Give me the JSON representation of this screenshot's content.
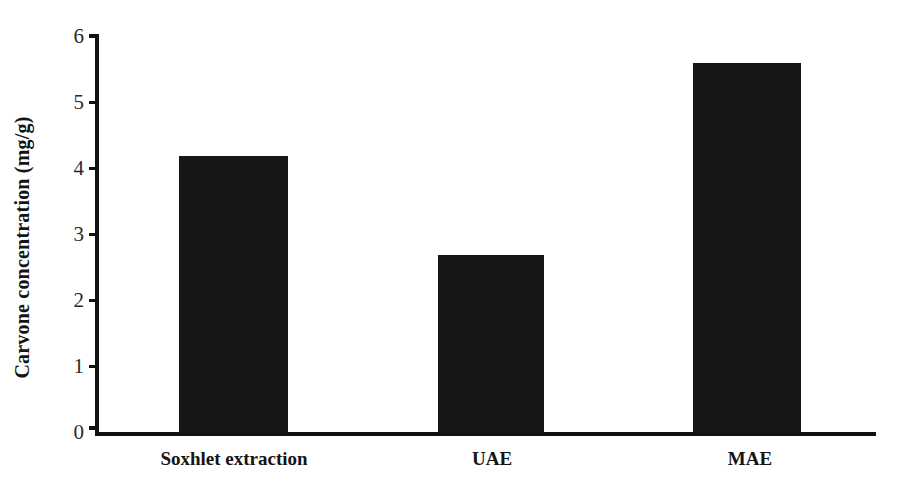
{
  "chart_data": {
    "type": "bar",
    "title": "",
    "xlabel": "",
    "ylabel": "Carvone concentration  (mg/g)",
    "categories": [
      "Soxhlet extraction",
      "UAE",
      "MAE"
    ],
    "values": [
      4.2,
      2.7,
      5.6
    ],
    "ylim": [
      0,
      6
    ],
    "yticks": [
      0,
      1,
      2,
      3,
      4,
      5,
      6
    ],
    "ytick_labels": [
      "0",
      "1",
      "2",
      "3",
      "4",
      "5",
      "6"
    ],
    "grid": false,
    "legend": null,
    "bar_color": "#161616",
    "axis_color": "#111111"
  },
  "axis": {
    "y_title": "Carvone concentration  (mg/g)",
    "tick_6": "6",
    "tick_5": "5",
    "tick_4": "4",
    "tick_3": "3",
    "tick_2": "2",
    "tick_1": "1",
    "tick_0": "0"
  },
  "categories": {
    "cat_0": "Soxhlet extraction",
    "cat_1": "UAE",
    "cat_2": "MAE"
  }
}
